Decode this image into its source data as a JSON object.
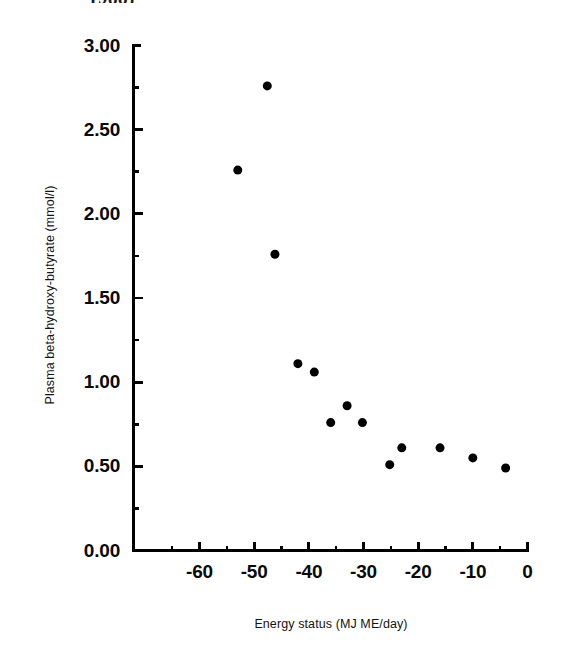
{
  "caption_fragment": "1988)",
  "chart_data": {
    "type": "scatter",
    "title": "",
    "xlabel": "Energy status (MJ ME/day)",
    "ylabel": "Plasma beta-hydroxy-butyrate (mmol/l)",
    "xlim": [
      -65.6,
      0
    ],
    "ylim": [
      0.0,
      3.0
    ],
    "xticks": [
      -60,
      -50,
      -40,
      -30,
      -20,
      -10,
      0
    ],
    "xticklabels": [
      "-60",
      "-50",
      "-40",
      "-30",
      "-20",
      "-10",
      "0"
    ],
    "yticks": [
      0.0,
      0.5,
      1.0,
      1.5,
      2.0,
      2.5,
      3.0
    ],
    "yticklabels": [
      "0.00",
      "0.50",
      "1.00",
      "1.50",
      "2.00",
      "2.50",
      "3.00"
    ],
    "minor_ticks": true,
    "grid": false,
    "legend": null,
    "marker": "filled-circle",
    "marker_color": "#000000",
    "marker_size": 9,
    "points": [
      {
        "x": -53.0,
        "y": 2.26
      },
      {
        "x": -47.6,
        "y": 2.76
      },
      {
        "x": -46.2,
        "y": 1.76
      },
      {
        "x": -42.0,
        "y": 1.11
      },
      {
        "x": -39.0,
        "y": 1.06
      },
      {
        "x": -36.0,
        "y": 0.76
      },
      {
        "x": -33.0,
        "y": 0.86
      },
      {
        "x": -30.2,
        "y": 0.76
      },
      {
        "x": -25.2,
        "y": 0.51
      },
      {
        "x": -23.0,
        "y": 0.61
      },
      {
        "x": -16.0,
        "y": 0.61
      },
      {
        "x": -10.0,
        "y": 0.55
      },
      {
        "x": -4.0,
        "y": 0.49
      }
    ],
    "series": [
      {
        "name": "Plasma beta-hydroxy-butyrate",
        "x": [
          -53.0,
          -47.6,
          -46.2,
          -42.0,
          -39.0,
          -36.0,
          -33.0,
          -30.2,
          -25.2,
          -23.0,
          -16.0,
          -10.0,
          -4.0
        ],
        "y": [
          2.26,
          2.76,
          1.76,
          1.11,
          1.06,
          0.76,
          0.86,
          0.76,
          0.51,
          0.61,
          0.61,
          0.55,
          0.49
        ]
      }
    ]
  },
  "colors": {
    "ink": "#000000",
    "background": "#ffffff"
  }
}
